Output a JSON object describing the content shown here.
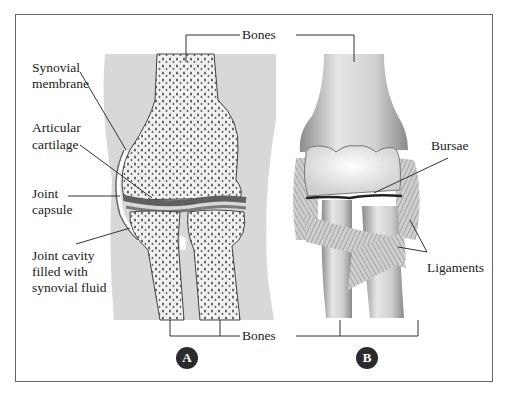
{
  "figure": {
    "panels": [
      {
        "id": "A",
        "badge": "A",
        "description": "knee joint cross-section"
      },
      {
        "id": "B",
        "badge": "B",
        "description": "knee joint external view"
      }
    ],
    "labels": {
      "bones_top": "Bones",
      "bones_bottom": "Bones",
      "synovial_membrane_1": "Synovial",
      "synovial_membrane_2": "membrane",
      "articular_cartilage_1": "Articular",
      "articular_cartilage_2": "cartilage",
      "joint_capsule_1": "Joint",
      "joint_capsule_2": "capsule",
      "joint_cavity_1": "Joint cavity",
      "joint_cavity_2": "filled with",
      "joint_cavity_3": "synovial fluid",
      "bursae": "Bursae",
      "ligaments": "Ligaments"
    },
    "colors": {
      "background_tissue": "#d9d9d9",
      "bone_fill": "#efefef",
      "cartilage": "#6f6f6f",
      "badge": "#2b2b2b",
      "frame": "#666666"
    }
  }
}
